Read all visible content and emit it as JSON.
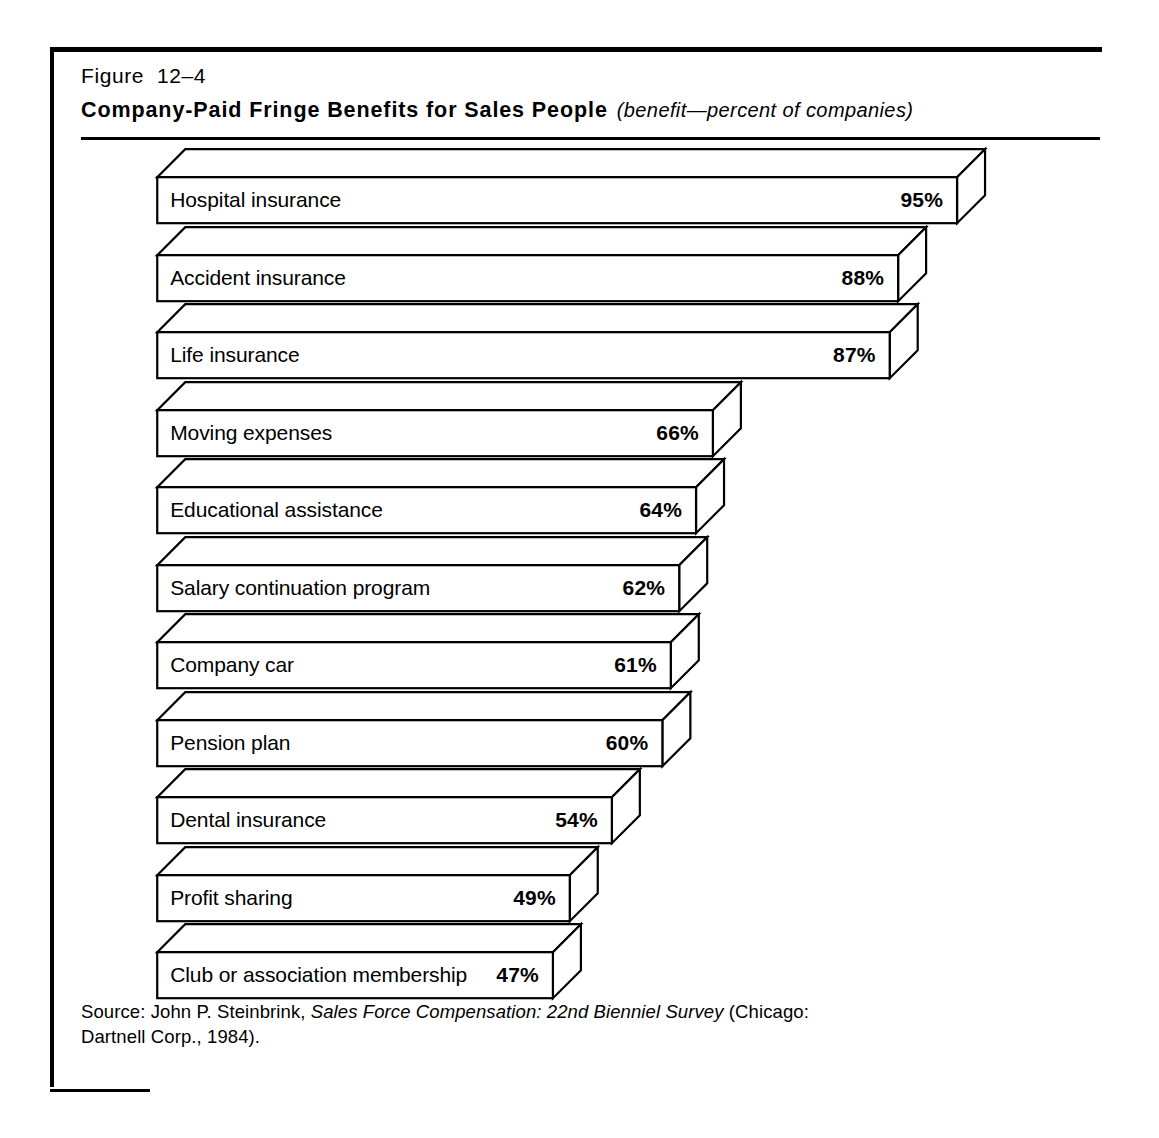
{
  "figure": {
    "number": "Figure  12–4",
    "title": "Company-Paid Fringe Benefits for Sales People",
    "subtitle": "(benefit—percent of companies)"
  },
  "source": {
    "prefix": "Source: John P. Steinbrink, ",
    "italic_title": "Sales Force Compensation: 22nd Bienniel Survey",
    "suffix": " (Chicago:",
    "line2": "Dartnell  Corp., 1984)."
  },
  "colors": {
    "ink": "#000000",
    "paper": "#ffffff",
    "bar_fill": "#ffffff"
  },
  "chart_data": {
    "type": "bar",
    "orientation": "horizontal",
    "title": "Company-Paid Fringe Benefits for Sales People",
    "subtitle": "(benefit—percent of companies)",
    "xlabel": "percent of companies",
    "ylabel": "benefit",
    "xlim": [
      0,
      100
    ],
    "grid": false,
    "legend": null,
    "value_suffix": "%",
    "categories": [
      "Hospital insurance",
      "Accident insurance",
      "Life insurance",
      "Moving expenses",
      "Educational assistance",
      "Salary continuation program",
      "Company car",
      "Pension plan",
      "Dental insurance",
      "Profit sharing",
      "Club or association membership"
    ],
    "values": [
      95,
      88,
      87,
      66,
      64,
      62,
      61,
      60,
      54,
      49,
      47
    ],
    "value_labels": [
      "95%",
      "88%",
      "87%",
      "66%",
      "64%",
      "62%",
      "61%",
      "60%",
      "54%",
      "49%",
      "47%"
    ]
  },
  "bars": [
    {
      "label": "Hospital insurance",
      "value": 95,
      "value_label": "95%"
    },
    {
      "label": "Accident insurance",
      "value": 88,
      "value_label": "88%"
    },
    {
      "label": "Life insurance",
      "value": 87,
      "value_label": "87%"
    },
    {
      "label": "Moving expenses",
      "value": 66,
      "value_label": "66%"
    },
    {
      "label": "Educational assistance",
      "value": 64,
      "value_label": "64%"
    },
    {
      "label": "Salary continuation program",
      "value": 62,
      "value_label": "62%"
    },
    {
      "label": "Company car",
      "value": 61,
      "value_label": "61%"
    },
    {
      "label": "Pension plan",
      "value": 60,
      "value_label": "60%"
    },
    {
      "label": "Dental insurance",
      "value": 54,
      "value_label": "54%"
    },
    {
      "label": "Profit sharing",
      "value": 49,
      "value_label": "49%"
    },
    {
      "label": "Club or association membership",
      "value": 47,
      "value_label": "47%"
    }
  ]
}
